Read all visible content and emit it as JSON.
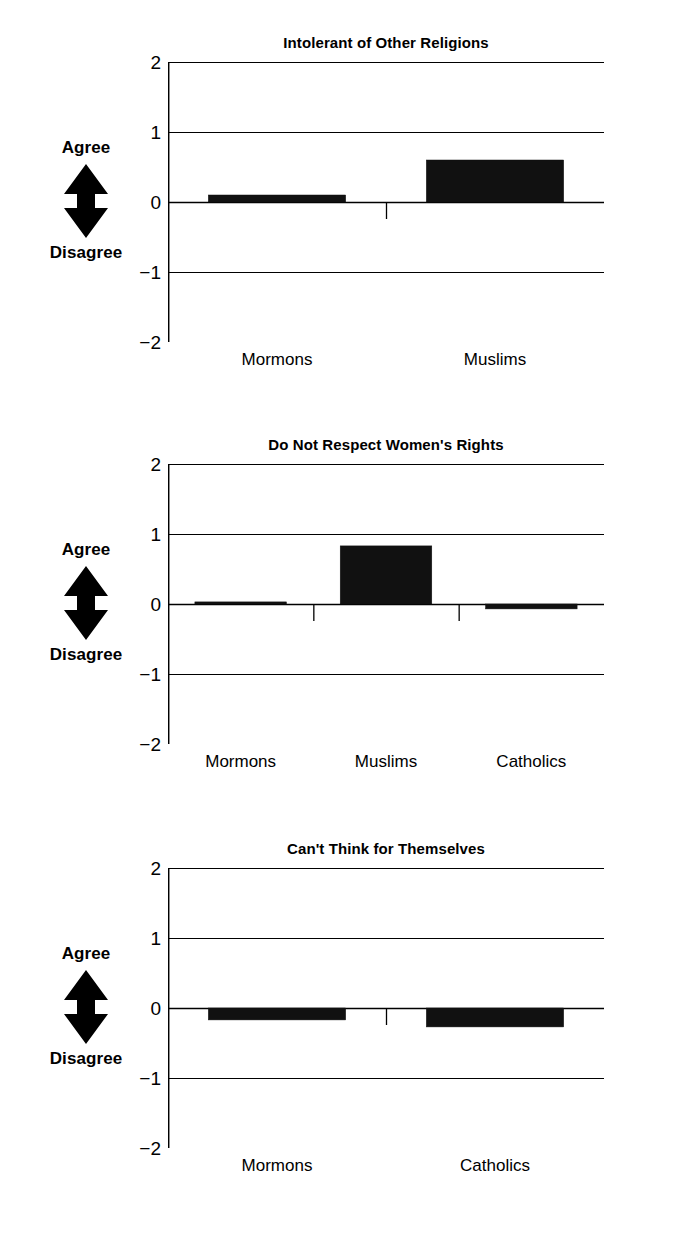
{
  "axis_scale": {
    "ticks": [
      "2",
      "1",
      "0",
      "-1",
      "-2"
    ],
    "ymin": -2,
    "ymax": 2
  },
  "arrow": {
    "top_label": "Agree",
    "bottom_label": "Disagree",
    "icon": "double-headed-vertical-arrow-icon"
  },
  "chart_data": [
    {
      "type": "bar",
      "title": "Intolerant of Other Religions",
      "categories": [
        "Mormons",
        "Muslims"
      ],
      "values": [
        0.1,
        0.6
      ],
      "xlabel": "",
      "ylabel": "Agree / Disagree",
      "ylim": [
        -2,
        2
      ],
      "yticks": [
        2,
        1,
        0,
        -1,
        -2
      ],
      "grid": true,
      "legend": "none",
      "bar_color": "#111111"
    },
    {
      "type": "bar",
      "title": "Do Not Respect Women's Rights",
      "categories": [
        "Mormons",
        "Muslims",
        "Catholics"
      ],
      "values": [
        0.03,
        0.83,
        -0.07
      ],
      "xlabel": "",
      "ylabel": "Agree / Disagree",
      "ylim": [
        -2,
        2
      ],
      "yticks": [
        2,
        1,
        0,
        -1,
        -2
      ],
      "grid": true,
      "legend": "none",
      "bar_color": "#111111"
    },
    {
      "type": "bar",
      "title": "Can't Think for Themselves",
      "categories": [
        "Mormons",
        "Catholics"
      ],
      "values": [
        -0.17,
        -0.27
      ],
      "xlabel": "",
      "ylabel": "Agree / Disagree",
      "ylim": [
        -2,
        2
      ],
      "yticks": [
        2,
        1,
        0,
        -1,
        -2
      ],
      "grid": true,
      "legend": "none",
      "bar_color": "#111111"
    }
  ]
}
